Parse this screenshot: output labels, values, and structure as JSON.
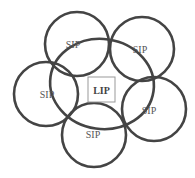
{
  "diagram": {
    "center_label": "LIP",
    "nodes": [
      {
        "label": "SIP",
        "cx": 77,
        "cy": 44,
        "r": 32,
        "lx": 73,
        "ly": 48
      },
      {
        "label": "SIP",
        "cx": 142,
        "cy": 49,
        "r": 32,
        "lx": 140,
        "ly": 53
      },
      {
        "label": "SIP",
        "cx": 46,
        "cy": 94,
        "r": 32,
        "lx": 47,
        "ly": 98
      },
      {
        "label": "SIP",
        "cx": 154,
        "cy": 109,
        "r": 32,
        "lx": 149,
        "ly": 114
      },
      {
        "label": "SIP",
        "cx": 94,
        "cy": 135,
        "r": 32,
        "lx": 93,
        "ly": 138
      }
    ],
    "colors": {
      "stroke": "#444444",
      "box": "#999999",
      "text": "#555555"
    }
  }
}
